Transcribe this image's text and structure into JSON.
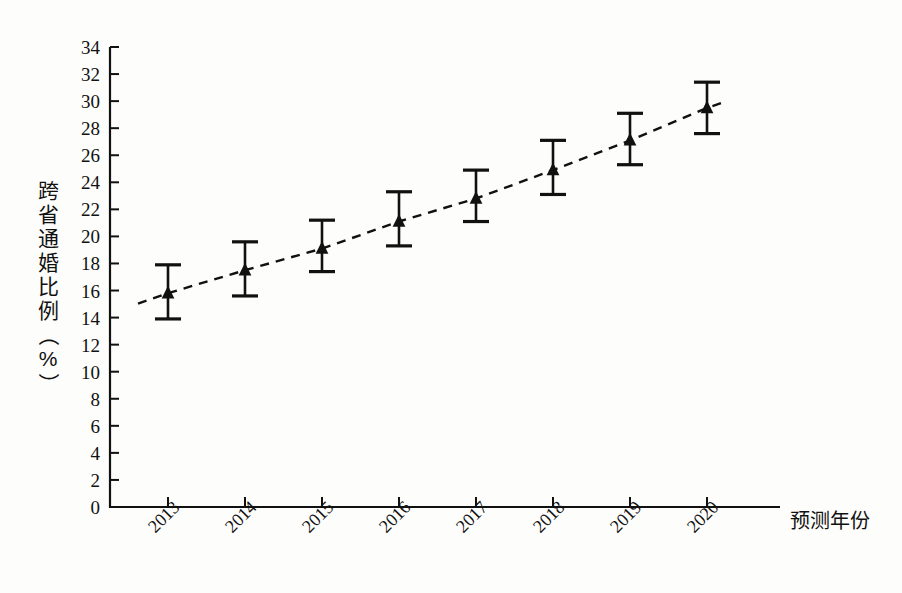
{
  "chart_data": {
    "type": "line",
    "title": "",
    "xlabel": "预测年份",
    "ylabel": "跨省通婚比例（%）",
    "ylabel_chars": [
      "跨",
      "省",
      "通",
      "婚",
      "比",
      "例",
      "（",
      "%",
      "）"
    ],
    "categories": [
      "2013",
      "2014",
      "2015",
      "2016",
      "2017",
      "2018",
      "2019",
      "2020"
    ],
    "values": [
      15.8,
      17.5,
      19.1,
      21.1,
      22.8,
      24.9,
      27.1,
      29.5
    ],
    "error_low": [
      13.9,
      15.6,
      17.4,
      19.3,
      21.1,
      23.1,
      25.3,
      27.6
    ],
    "error_high": [
      17.9,
      19.6,
      21.2,
      23.3,
      24.9,
      27.1,
      29.1,
      31.4
    ],
    "ylim": [
      0,
      34
    ],
    "ytick_step": 2,
    "yticks": [
      0,
      2,
      4,
      6,
      8,
      10,
      12,
      14,
      16,
      18,
      20,
      22,
      24,
      26,
      28,
      30,
      32,
      34
    ],
    "grid": false,
    "legend": "none",
    "marker": "triangle",
    "line_style": "dashed",
    "xtick_rotation": -45,
    "series_name": "跨省通婚比例",
    "colors": {
      "line": "#111111",
      "marker": "#111111",
      "error_bar": "#111111",
      "axis": "#111111",
      "background": "#fdfdfb"
    }
  }
}
